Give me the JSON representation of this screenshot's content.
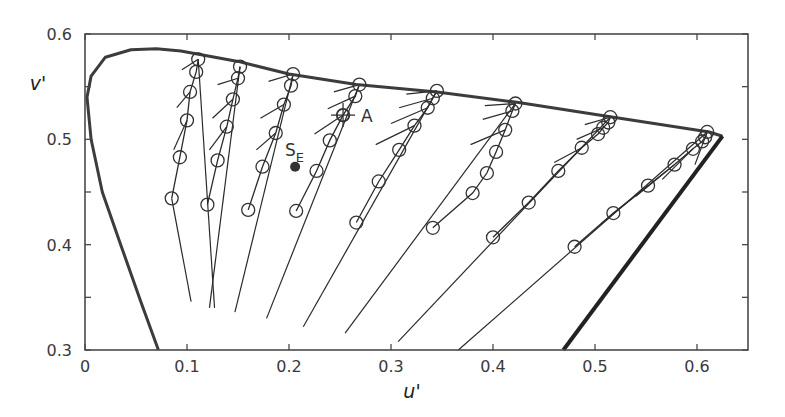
{
  "chart_data": {
    "type": "line",
    "title": "",
    "xlabel": "u'",
    "ylabel": "v'",
    "xlim": [
      0,
      0.65
    ],
    "ylim": [
      0.3,
      0.6
    ],
    "xticks": [
      0,
      0.1,
      0.2,
      0.3,
      0.4,
      0.5,
      0.6
    ],
    "yticks": [
      0.3,
      0.4,
      0.5,
      0.6
    ],
    "xtick_labels": [
      "0",
      "0.1",
      "0.2",
      "0.3",
      "0.4",
      "0.5",
      "0.6"
    ],
    "ytick_labels": [
      "0.3",
      "0.4",
      "0.5",
      "0.6"
    ],
    "grid": false,
    "legend": null,
    "spectrum_locus": [
      [
        0.072,
        0.3
      ],
      [
        0.055,
        0.345
      ],
      [
        0.035,
        0.4
      ],
      [
        0.017,
        0.45
      ],
      [
        0.006,
        0.5
      ],
      [
        0.002,
        0.54
      ],
      [
        0.006,
        0.56
      ],
      [
        0.02,
        0.578
      ],
      [
        0.045,
        0.585
      ],
      [
        0.07,
        0.586
      ],
      [
        0.094,
        0.584
      ],
      [
        0.15,
        0.574
      ],
      [
        0.2,
        0.562
      ],
      [
        0.266,
        0.552
      ],
      [
        0.345,
        0.545
      ],
      [
        0.425,
        0.535
      ],
      [
        0.518,
        0.521
      ],
      [
        0.612,
        0.507
      ],
      [
        0.625,
        0.503
      ]
    ],
    "purple_line": [
      [
        0.625,
        0.503
      ],
      [
        0.469,
        0.3
      ]
    ],
    "series": [
      {
        "name": "family-1",
        "points": [
          [
            0.111,
            0.576
          ],
          [
            0.109,
            0.564
          ],
          [
            0.103,
            0.545
          ],
          [
            0.1,
            0.518
          ],
          [
            0.093,
            0.483
          ],
          [
            0.085,
            0.444
          ]
        ],
        "rays": [
          [
            [
              0.111,
              0.576
            ],
            [
              0.127,
              0.34
            ]
          ],
          [
            [
              0.111,
              0.576
            ],
            [
              0.095,
              0.566
            ]
          ],
          [
            [
              0.103,
              0.545
            ],
            [
              0.09,
              0.53
            ]
          ],
          [
            [
              0.1,
              0.518
            ],
            [
              0.087,
              0.49
            ]
          ],
          [
            [
              0.085,
              0.444
            ],
            [
              0.104,
              0.346
            ]
          ]
        ]
      },
      {
        "name": "family-2",
        "points": [
          [
            0.152,
            0.569
          ],
          [
            0.15,
            0.558
          ],
          [
            0.145,
            0.538
          ],
          [
            0.139,
            0.512
          ],
          [
            0.13,
            0.48
          ],
          [
            0.12,
            0.438
          ]
        ],
        "rays": [
          [
            [
              0.152,
              0.569
            ],
            [
              0.122,
              0.34
            ]
          ],
          [
            [
              0.15,
              0.558
            ],
            [
              0.13,
              0.552
            ]
          ],
          [
            [
              0.145,
              0.538
            ],
            [
              0.125,
              0.52
            ]
          ],
          [
            [
              0.139,
              0.512
            ],
            [
              0.122,
              0.49
            ]
          ]
        ]
      },
      {
        "name": "family-3",
        "points": [
          [
            0.204,
            0.562
          ],
          [
            0.202,
            0.551
          ],
          [
            0.195,
            0.533
          ],
          [
            0.187,
            0.506
          ],
          [
            0.174,
            0.474
          ],
          [
            0.16,
            0.433
          ]
        ],
        "rays": [
          [
            [
              0.204,
              0.562
            ],
            [
              0.147,
              0.336
            ]
          ],
          [
            [
              0.204,
              0.562
            ],
            [
              0.18,
              0.555
            ]
          ],
          [
            [
              0.195,
              0.533
            ],
            [
              0.172,
              0.52
            ]
          ],
          [
            [
              0.187,
              0.506
            ],
            [
              0.168,
              0.49
            ]
          ]
        ]
      },
      {
        "name": "family-4",
        "points": [
          [
            0.269,
            0.552
          ],
          [
            0.265,
            0.541
          ],
          [
            0.253,
            0.523
          ],
          [
            0.24,
            0.499
          ],
          [
            0.227,
            0.47
          ],
          [
            0.207,
            0.432
          ]
        ],
        "rays": [
          [
            [
              0.269,
              0.552
            ],
            [
              0.178,
              0.33
            ]
          ],
          [
            [
              0.269,
              0.552
            ],
            [
              0.244,
              0.545
            ]
          ],
          [
            [
              0.265,
              0.541
            ],
            [
              0.238,
              0.529
            ]
          ],
          [
            [
              0.253,
              0.523
            ],
            [
              0.225,
              0.505
            ]
          ]
        ]
      },
      {
        "name": "family-5",
        "points": [
          [
            0.345,
            0.546
          ],
          [
            0.341,
            0.539
          ],
          [
            0.336,
            0.53
          ],
          [
            0.323,
            0.513
          ],
          [
            0.308,
            0.49
          ],
          [
            0.288,
            0.46
          ],
          [
            0.266,
            0.421
          ]
        ],
        "rays": [
          [
            [
              0.345,
              0.546
            ],
            [
              0.214,
              0.322
            ]
          ],
          [
            [
              0.345,
              0.546
            ],
            [
              0.315,
              0.543
            ]
          ],
          [
            [
              0.341,
              0.539
            ],
            [
              0.308,
              0.53
            ]
          ],
          [
            [
              0.336,
              0.53
            ],
            [
              0.3,
              0.515
            ]
          ],
          [
            [
              0.323,
              0.513
            ],
            [
              0.285,
              0.495
            ]
          ]
        ]
      },
      {
        "name": "family-6",
        "points": [
          [
            0.422,
            0.534
          ],
          [
            0.419,
            0.527
          ],
          [
            0.412,
            0.509
          ],
          [
            0.403,
            0.488
          ],
          [
            0.394,
            0.468
          ],
          [
            0.38,
            0.449
          ],
          [
            0.341,
            0.416
          ]
        ],
        "rays": [
          [
            [
              0.422,
              0.534
            ],
            [
              0.255,
              0.316
            ]
          ],
          [
            [
              0.422,
              0.534
            ],
            [
              0.392,
              0.532
            ]
          ],
          [
            [
              0.419,
              0.527
            ],
            [
              0.39,
              0.519
            ]
          ],
          [
            [
              0.412,
              0.509
            ],
            [
              0.378,
              0.495
            ]
          ]
        ]
      },
      {
        "name": "family-7",
        "points": [
          [
            0.515,
            0.521
          ],
          [
            0.513,
            0.516
          ],
          [
            0.508,
            0.511
          ],
          [
            0.503,
            0.505
          ],
          [
            0.487,
            0.492
          ],
          [
            0.464,
            0.47
          ],
          [
            0.435,
            0.44
          ],
          [
            0.4,
            0.407
          ]
        ],
        "rays": [
          [
            [
              0.515,
              0.521
            ],
            [
              0.307,
              0.308
            ]
          ],
          [
            [
              0.515,
              0.521
            ],
            [
              0.49,
              0.514
            ]
          ],
          [
            [
              0.508,
              0.511
            ],
            [
              0.482,
              0.5
            ]
          ],
          [
            [
              0.487,
              0.492
            ],
            [
              0.46,
              0.478
            ]
          ]
        ]
      },
      {
        "name": "family-8",
        "points": [
          [
            0.61,
            0.507
          ],
          [
            0.608,
            0.502
          ],
          [
            0.605,
            0.498
          ],
          [
            0.596,
            0.491
          ],
          [
            0.578,
            0.476
          ],
          [
            0.552,
            0.456
          ],
          [
            0.518,
            0.43
          ],
          [
            0.48,
            0.398
          ]
        ],
        "rays": [
          [
            [
              0.61,
              0.507
            ],
            [
              0.366,
              0.3
            ]
          ],
          [
            [
              0.61,
              0.507
            ],
            [
              0.598,
              0.476
            ]
          ],
          [
            [
              0.596,
              0.491
            ],
            [
              0.566,
              0.462
            ]
          ],
          [
            [
              0.578,
              0.476
            ],
            [
              0.54,
              0.446
            ]
          ],
          [
            [
              0.552,
              0.456
            ],
            [
              0.506,
              0.42
            ]
          ]
        ]
      }
    ],
    "annotations": [
      {
        "name": "A",
        "label": "A",
        "u": 0.253,
        "v": 0.523,
        "marker": "crosshair-circle"
      },
      {
        "name": "SE",
        "label": "S",
        "subscript": "E",
        "u": 0.206,
        "v": 0.474,
        "marker": "filled-circle"
      }
    ]
  },
  "axes": {
    "x_label": "u'",
    "y_label": "v'"
  },
  "annotations": {
    "a_label": "A",
    "se_label": "S",
    "se_subscript": "E"
  },
  "colors": {
    "frame": "#4a4a4a",
    "locus": "#3c3c3c",
    "lines": "#2a2a2a",
    "markers": "#333333",
    "text": "#3a3a3a"
  }
}
